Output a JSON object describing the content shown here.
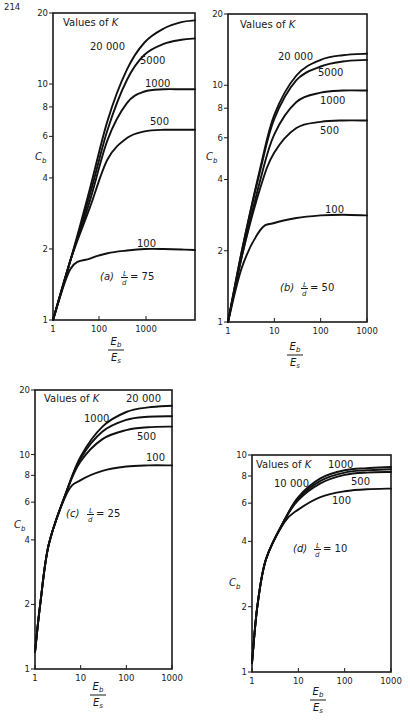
{
  "page": {
    "number": "214"
  },
  "chart_data": [
    {
      "id": "a",
      "type": "line",
      "caption": "(a) L/d = 75",
      "panel_label": "(a)",
      "ratio_label": "= 75",
      "legend_title": "Values of K",
      "xlabel": "Eb/Es",
      "ylabel": "Cb",
      "x_scale": "log",
      "y_scale": "log",
      "xlim": [
        1,
        7000
      ],
      "ylim": [
        1,
        20
      ],
      "x_ticks": [
        "1",
        "100",
        "1000"
      ],
      "y_ticks": [
        "1",
        "2",
        "4",
        "6",
        "8",
        "10",
        "20"
      ],
      "series": [
        {
          "name": "20 000",
          "x": [
            1,
            3,
            10,
            30,
            100,
            300,
            1000,
            3000,
            7000
          ],
          "y": [
            1,
            1.8,
            3.6,
            7.0,
            11.5,
            15.0,
            17.2,
            18.3,
            18.6
          ]
        },
        {
          "name": "5000",
          "x": [
            1,
            3,
            10,
            30,
            100,
            300,
            1000,
            3000,
            7000
          ],
          "y": [
            1,
            1.8,
            3.4,
            6.4,
            10.4,
            13.3,
            14.8,
            15.4,
            15.6
          ]
        },
        {
          "name": "1000",
          "x": [
            1,
            3,
            10,
            30,
            100,
            300,
            1000,
            3000,
            7000
          ],
          "y": [
            1,
            1.8,
            3.2,
            5.8,
            8.3,
            9.3,
            9.5,
            9.5,
            9.5
          ]
        },
        {
          "name": "500",
          "x": [
            1,
            3,
            10,
            30,
            100,
            300,
            1000,
            3000,
            7000
          ],
          "y": [
            1,
            1.8,
            3.0,
            4.8,
            5.9,
            6.3,
            6.4,
            6.4,
            6.4
          ]
        },
        {
          "name": "100",
          "x": [
            1,
            3,
            10,
            30,
            100,
            300,
            1000,
            3000,
            7000
          ],
          "y": [
            1,
            1.65,
            1.82,
            1.92,
            1.97,
            2.0,
            2.0,
            1.99,
            1.98
          ]
        }
      ]
    },
    {
      "id": "b",
      "type": "line",
      "caption": "(b) L/d = 50",
      "panel_label": "(b)",
      "ratio_label": "= 50",
      "legend_title": "Values of K",
      "xlabel": "Eb/Es",
      "ylabel": "Cb",
      "x_scale": "log",
      "y_scale": "log",
      "xlim": [
        1,
        1000
      ],
      "ylim": [
        1,
        20
      ],
      "x_ticks": [
        "1",
        "10",
        "100",
        "1000"
      ],
      "y_ticks": [
        "1",
        "2",
        "4",
        "6",
        "8",
        "10",
        "20"
      ],
      "series": [
        {
          "name": "20 000",
          "x": [
            1,
            2,
            5,
            10,
            30,
            100,
            300,
            1000
          ],
          "y": [
            1,
            2.0,
            4.5,
            7.5,
            11.0,
            12.8,
            13.4,
            13.6
          ]
        },
        {
          "name": "5000",
          "x": [
            1,
            2,
            5,
            10,
            30,
            100,
            300,
            1000
          ],
          "y": [
            1,
            2.0,
            4.4,
            7.2,
            10.5,
            12.0,
            12.6,
            12.8
          ]
        },
        {
          "name": "1000",
          "x": [
            1,
            2,
            5,
            10,
            30,
            100,
            300,
            1000
          ],
          "y": [
            1,
            1.9,
            4.0,
            6.2,
            8.5,
            9.3,
            9.5,
            9.5
          ]
        },
        {
          "name": "500",
          "x": [
            1,
            2,
            5,
            10,
            30,
            100,
            300,
            1000
          ],
          "y": [
            1,
            1.9,
            3.7,
            5.2,
            6.6,
            7.0,
            7.1,
            7.1
          ]
        },
        {
          "name": "100",
          "x": [
            1,
            2,
            5,
            10,
            30,
            100,
            300,
            1000
          ],
          "y": [
            1,
            1.7,
            2.45,
            2.62,
            2.75,
            2.82,
            2.84,
            2.82
          ]
        }
      ]
    },
    {
      "id": "c",
      "type": "line",
      "caption": "(c) L/d = 25",
      "panel_label": "(c)",
      "ratio_label": "= 25",
      "legend_title": "Values of K",
      "xlabel": "Eb/Es",
      "ylabel": "Cb",
      "x_scale": "log",
      "y_scale": "log",
      "xlim": [
        1,
        1000
      ],
      "ylim": [
        1,
        20
      ],
      "x_ticks": [
        "1",
        "10",
        "100",
        "1000"
      ],
      "y_ticks": [
        "1",
        "2",
        "4",
        "6",
        "8",
        "10",
        "20"
      ],
      "series": [
        {
          "name": "20 000",
          "x": [
            1,
            1.3,
            2,
            5,
            10,
            30,
            100,
            300,
            1000
          ],
          "y": [
            1.2,
            2.0,
            3.8,
            6.8,
            9.8,
            13.5,
            15.8,
            16.6,
            16.9
          ]
        },
        {
          "name": "1000",
          "x": [
            1,
            1.3,
            2,
            5,
            10,
            30,
            100,
            300,
            1000
          ],
          "y": [
            1.2,
            2.0,
            3.8,
            6.8,
            9.6,
            12.8,
            14.5,
            15.0,
            15.1
          ]
        },
        {
          "name": "500",
          "x": [
            1,
            1.3,
            2,
            5,
            10,
            30,
            100,
            300,
            1000
          ],
          "y": [
            1.2,
            2.0,
            3.8,
            6.8,
            9.3,
            11.8,
            13.0,
            13.4,
            13.5
          ]
        },
        {
          "name": "100",
          "x": [
            1,
            1.3,
            2,
            5,
            10,
            30,
            100,
            300,
            1000
          ],
          "y": [
            1.2,
            2.0,
            3.8,
            6.6,
            7.6,
            8.4,
            8.8,
            8.9,
            8.9
          ]
        }
      ]
    },
    {
      "id": "d",
      "type": "line",
      "caption": "(d) L/d = 10",
      "panel_label": "(d)",
      "ratio_label": "= 10",
      "legend_title": "Values of K",
      "xlabel": "Eb/Es",
      "ylabel": "Cb",
      "x_scale": "log",
      "y_scale": "log",
      "xlim": [
        1,
        1000
      ],
      "ylim": [
        1,
        10
      ],
      "x_ticks": [
        "1",
        "10",
        "100",
        "1000"
      ],
      "y_ticks": [
        "1",
        "2",
        "4",
        "6",
        "8",
        "10"
      ],
      "series": [
        {
          "name": "10 000",
          "x": [
            1,
            1.3,
            2,
            5,
            10,
            30,
            100,
            300,
            1000
          ],
          "y": [
            1.1,
            2.0,
            3.3,
            5.0,
            6.4,
            7.8,
            8.5,
            8.7,
            8.8
          ]
        },
        {
          "name": "1000",
          "x": [
            1,
            1.3,
            2,
            5,
            10,
            30,
            100,
            300,
            1000
          ],
          "y": [
            1.1,
            2.0,
            3.3,
            5.0,
            6.3,
            7.6,
            8.3,
            8.5,
            8.6
          ]
        },
        {
          "name": "500",
          "x": [
            1,
            1.3,
            2,
            5,
            10,
            30,
            100,
            300,
            1000
          ],
          "y": [
            1.1,
            2.0,
            3.3,
            5.0,
            6.2,
            7.4,
            8.1,
            8.3,
            8.35
          ]
        },
        {
          "name": "100",
          "x": [
            1,
            1.3,
            2,
            5,
            10,
            30,
            100,
            300,
            1000
          ],
          "y": [
            1.1,
            2.0,
            3.3,
            4.9,
            5.6,
            6.4,
            6.8,
            6.95,
            7.0
          ]
        }
      ]
    }
  ]
}
